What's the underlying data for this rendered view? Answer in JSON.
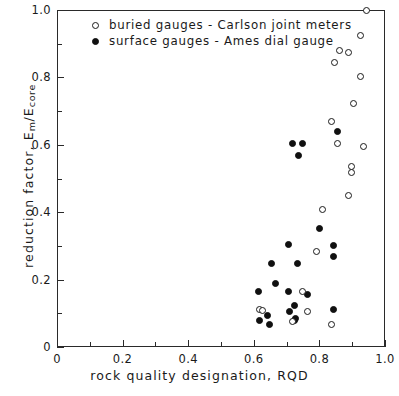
{
  "chart_data": {
    "type": "scatter",
    "title": "",
    "xlabel": "rock quality designation, RQD",
    "ylabel_main": "reduction factor, E",
    "ylabel_sub1": "m",
    "ylabel_mid": "/E",
    "ylabel_sub2": "core",
    "ylabel_full": "reduction factor, Em/Ecore",
    "xlim": [
      0,
      1.0
    ],
    "ylim": [
      0,
      1.0
    ],
    "xticks": [
      0,
      0.2,
      0.4,
      0.6,
      0.8,
      1.0
    ],
    "yticks": [
      0,
      0.2,
      0.4,
      0.6,
      0.8,
      1.0
    ],
    "xticklabels": [
      "0",
      "0.2",
      "0.4",
      "0.6",
      "0.8",
      "1.0"
    ],
    "yticklabels": [
      "0",
      "0.2",
      "0.4",
      "0.6",
      "0.8",
      "1.0"
    ],
    "xminorticks": [
      0.1,
      0.3,
      0.5,
      0.7,
      0.9
    ],
    "yminorticks": [
      0.1,
      0.3,
      0.5,
      0.7,
      0.9
    ],
    "grid": false,
    "legend_position": "upper left",
    "series": [
      {
        "name": "buried gauges - Carlson joint meters",
        "marker": "open-circle",
        "color": "#101010",
        "points": [
          [
            0.945,
            0.998
          ],
          [
            0.925,
            0.925
          ],
          [
            0.862,
            0.88
          ],
          [
            0.888,
            0.873
          ],
          [
            0.845,
            0.845
          ],
          [
            0.925,
            0.803
          ],
          [
            0.905,
            0.723
          ],
          [
            0.838,
            0.668
          ],
          [
            0.855,
            0.603
          ],
          [
            0.935,
            0.595
          ],
          [
            0.898,
            0.535
          ],
          [
            0.898,
            0.518
          ],
          [
            0.89,
            0.45
          ],
          [
            0.808,
            0.408
          ],
          [
            0.79,
            0.283
          ],
          [
            0.748,
            0.165
          ],
          [
            0.618,
            0.112
          ],
          [
            0.625,
            0.108
          ],
          [
            0.763,
            0.105
          ],
          [
            0.718,
            0.077
          ],
          [
            0.838,
            0.068
          ]
        ]
      },
      {
        "name": "surface gauges - Ames dial gauge",
        "marker": "filled-circle",
        "color": "#101010",
        "points": [
          [
            0.855,
            0.638
          ],
          [
            0.718,
            0.605
          ],
          [
            0.748,
            0.603
          ],
          [
            0.735,
            0.567
          ],
          [
            0.8,
            0.353
          ],
          [
            0.705,
            0.305
          ],
          [
            0.843,
            0.3
          ],
          [
            0.843,
            0.268
          ],
          [
            0.655,
            0.248
          ],
          [
            0.733,
            0.248
          ],
          [
            0.665,
            0.188
          ],
          [
            0.613,
            0.165
          ],
          [
            0.705,
            0.165
          ],
          [
            0.763,
            0.155
          ],
          [
            0.723,
            0.122
          ],
          [
            0.843,
            0.11
          ],
          [
            0.71,
            0.105
          ],
          [
            0.728,
            0.085
          ],
          [
            0.643,
            0.092
          ],
          [
            0.723,
            0.078
          ],
          [
            0.618,
            0.08
          ],
          [
            0.648,
            0.068
          ]
        ]
      }
    ]
  },
  "legend": {
    "entries": [
      {
        "label": "buried gauges - Carlson joint meters",
        "marker": "open-circle"
      },
      {
        "label": "surface gauges - Ames dial gauge",
        "marker": "filled-circle"
      }
    ]
  }
}
